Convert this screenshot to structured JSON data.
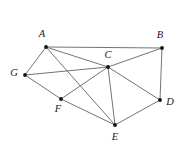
{
  "figure": {
    "kind": "undirected-graph-diagram",
    "background_color": "#ffffff",
    "edge_color": "#5a5a5a",
    "vertex_color": "#111111",
    "label_color": "#1a1a1a",
    "width": 187,
    "height": 150
  },
  "chart_data": {
    "type": "diagram",
    "title": "",
    "subtitle": "",
    "xlabel": "",
    "ylabel": "",
    "grid": false,
    "legend": "none",
    "graph_kind": "undirected",
    "vertex_count": 7,
    "edge_count": 13,
    "nodes": [
      {
        "id": "A",
        "label": "A",
        "x": 46,
        "y": 47,
        "label_x": 42,
        "label_y": 35,
        "anchor": "middle",
        "degree": 4
      },
      {
        "id": "B",
        "label": "B",
        "x": 162,
        "y": 48,
        "label_x": 160,
        "label_y": 36,
        "anchor": "middle",
        "degree": 3
      },
      {
        "id": "C",
        "label": "C",
        "x": 108,
        "y": 67,
        "label_x": 108,
        "label_y": 56,
        "anchor": "middle",
        "degree": 6
      },
      {
        "id": "D",
        "label": "D",
        "x": 160,
        "y": 100,
        "label_x": 170,
        "label_y": 103,
        "anchor": "middle",
        "degree": 3
      },
      {
        "id": "E",
        "label": "E",
        "x": 115,
        "y": 125,
        "label_x": 115,
        "label_y": 138,
        "anchor": "middle",
        "degree": 4
      },
      {
        "id": "F",
        "label": "F",
        "x": 61,
        "y": 99,
        "label_x": 58,
        "label_y": 110,
        "anchor": "middle",
        "degree": 3
      },
      {
        "id": "G",
        "label": "G",
        "x": 25,
        "y": 75,
        "label_x": 14,
        "label_y": 74,
        "anchor": "middle",
        "degree": 3
      }
    ],
    "edges": [
      {
        "id": "A-B",
        "source": "A",
        "target": "B"
      },
      {
        "id": "A-C",
        "source": "A",
        "target": "C"
      },
      {
        "id": "A-G",
        "source": "A",
        "target": "G"
      },
      {
        "id": "A-E",
        "source": "A",
        "target": "E"
      },
      {
        "id": "B-C",
        "source": "B",
        "target": "C"
      },
      {
        "id": "B-D",
        "source": "B",
        "target": "D"
      },
      {
        "id": "C-G",
        "source": "C",
        "target": "G"
      },
      {
        "id": "C-F",
        "source": "C",
        "target": "F"
      },
      {
        "id": "C-D",
        "source": "C",
        "target": "D"
      },
      {
        "id": "C-E",
        "source": "C",
        "target": "E"
      },
      {
        "id": "G-F",
        "source": "G",
        "target": "F"
      },
      {
        "id": "F-E",
        "source": "F",
        "target": "E"
      },
      {
        "id": "D-E",
        "source": "D",
        "target": "E"
      }
    ]
  }
}
